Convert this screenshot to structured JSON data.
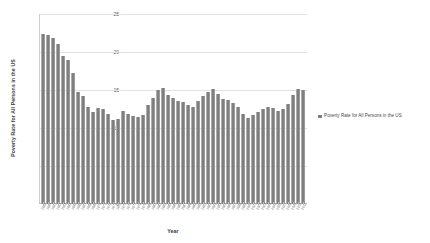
{
  "chart_data": {
    "type": "bar",
    "title": "",
    "xlabel": "Year",
    "ylabel": "Poverty Rate for All Persons in the US",
    "ylim": [
      0,
      25
    ],
    "yticks": [
      0,
      5,
      10,
      15,
      20,
      25
    ],
    "grid": true,
    "legend_position": "right",
    "series_name": "Poverty Rate for All Persons in the US",
    "bar_color": "#7f7f7f",
    "categories": [
      "1959",
      "1960",
      "1961",
      "1962",
      "1963",
      "1964",
      "1965",
      "1966",
      "1967",
      "1968",
      "1969",
      "1970",
      "1971",
      "1972",
      "1973",
      "1974",
      "1975",
      "1976",
      "1977",
      "1978",
      "1979",
      "1980",
      "1981",
      "1982",
      "1983",
      "1984",
      "1985",
      "1986",
      "1987",
      "1988",
      "1989",
      "1990",
      "1991",
      "1992",
      "1993",
      "1994",
      "1995",
      "1996",
      "1997",
      "1998",
      "1999",
      "2000",
      "2001",
      "2002",
      "2003",
      "2004",
      "2005",
      "2006",
      "2007",
      "2008",
      "2009",
      "2010",
      "2011"
    ],
    "values": [
      22.4,
      22.2,
      21.9,
      21.0,
      19.5,
      19.0,
      17.3,
      14.7,
      14.2,
      12.8,
      12.1,
      12.6,
      12.5,
      11.9,
      11.1,
      11.2,
      12.3,
      11.8,
      11.6,
      11.4,
      11.7,
      13.0,
      14.0,
      15.0,
      15.2,
      14.4,
      14.0,
      13.6,
      13.4,
      13.0,
      12.8,
      13.5,
      14.2,
      14.8,
      15.1,
      14.5,
      13.8,
      13.7,
      13.3,
      12.7,
      11.9,
      11.3,
      11.7,
      12.1,
      12.5,
      12.7,
      12.6,
      12.3,
      12.5,
      13.2,
      14.3,
      15.1,
      15.0
    ]
  },
  "legend": {
    "label": "Poverty Rate for All Persons in the US"
  },
  "axes": {
    "y_title": "Poverty Rate for All Persons in the US",
    "x_title": "Year"
  }
}
